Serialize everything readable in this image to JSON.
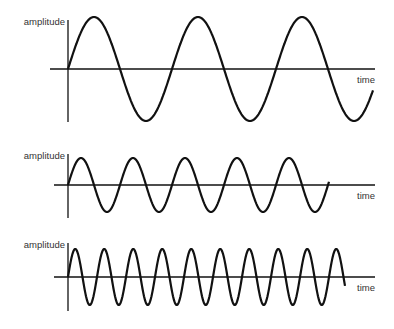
{
  "panels": [
    {
      "id": "low-frequency",
      "y_label": "amplitude",
      "x_label": "time",
      "cycles": 2.9,
      "period_px": 104,
      "baseline": 69,
      "amp": 52,
      "axis_top": 20,
      "axis_bottom": 122,
      "start": 68,
      "end": 373,
      "x_axis_start": 50,
      "x_axis_end": 375
    },
    {
      "id": "medium-frequency",
      "y_label": "amplitude",
      "x_label": "time",
      "cycles": 5,
      "period_px": 52,
      "baseline": 185,
      "amp": 27,
      "axis_top": 154,
      "axis_bottom": 218,
      "start": 68,
      "end": 329,
      "x_axis_start": 54,
      "x_axis_end": 375
    },
    {
      "id": "high-frequency",
      "y_label": "amplitude",
      "x_label": "time",
      "cycles": 9.6,
      "period_px": 29,
      "baseline": 277,
      "amp": 28,
      "axis_top": 243,
      "axis_bottom": 311,
      "start": 68,
      "end": 345,
      "x_axis_start": 54,
      "x_axis_end": 375
    }
  ],
  "colors": {
    "line": "#111111",
    "text": "#333333"
  }
}
